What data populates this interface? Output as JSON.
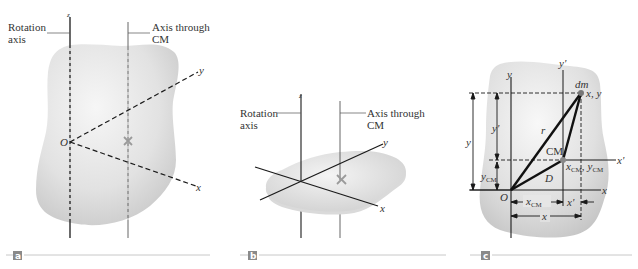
{
  "figure": {
    "panels": [
      {
        "id": "a",
        "tag": "a",
        "labels": {
          "rotation_axis_line1": "Rotation",
          "rotation_axis_line2": "axis",
          "cm_axis_line1": "Axis through",
          "cm_axis_line2": "CM",
          "z_axis": "z",
          "y_axis": "y",
          "x_axis": "x",
          "origin": "O"
        },
        "cm_marker": "×"
      },
      {
        "id": "b",
        "tag": "b",
        "labels": {
          "rotation_axis_line1": "Rotation",
          "rotation_axis_line2": "axis",
          "cm_axis_line1": "Axis through",
          "cm_axis_line2": "CM",
          "z_axis": "z",
          "y_axis": "y",
          "x_axis": "x"
        },
        "cm_marker": "×"
      },
      {
        "id": "c",
        "tag": "c",
        "labels": {
          "y_axis": "y",
          "y_prime_axis": "y'",
          "x_axis": "x",
          "x_prime_axis": "x'",
          "origin": "O",
          "dm": "dm",
          "dm_coords": "x, y",
          "cm": "CM",
          "cm_coords_x": "x",
          "cm_coords_x_sub": "CM",
          "cm_coords_sep": ",",
          "cm_coords_y": "y",
          "cm_coords_y_sub": "CM",
          "r": "r",
          "D": "D",
          "dim_y": "y",
          "dim_y_prime": "y'",
          "dim_ycm": "y",
          "dim_ycm_sub": "CM",
          "dim_xcm": "x",
          "dim_xcm_sub": "CM",
          "dim_x_prime": "x'",
          "dim_x": "x"
        }
      }
    ],
    "colors": {
      "body_fill": "#d4d4d4",
      "body_highlight": "#f2f2f2",
      "line": "#1a1a1a",
      "thin_line": "#555555",
      "tag_bg": "#8a8a8a",
      "rule": "#c8c8c8",
      "cm_marker": "#9a9a9a"
    }
  }
}
